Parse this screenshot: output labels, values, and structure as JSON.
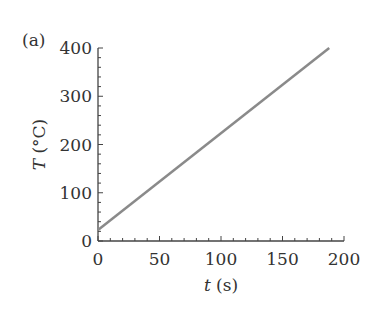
{
  "panel_label": "(a)",
  "chart_data": {
    "type": "line",
    "title": "",
    "xlabel": "t (s)",
    "ylabel": "T (°C)",
    "xlim": [
      0,
      200
    ],
    "ylim": [
      0,
      400
    ],
    "xticks": [
      0,
      50,
      100,
      150,
      200
    ],
    "yticks": [
      0,
      100,
      200,
      300,
      400
    ],
    "grid": false,
    "legend": null,
    "series": [
      {
        "name": "T(t)",
        "color": "#8a8a8a",
        "x": [
          0,
          188
        ],
        "y": [
          23,
          400
        ]
      }
    ]
  }
}
